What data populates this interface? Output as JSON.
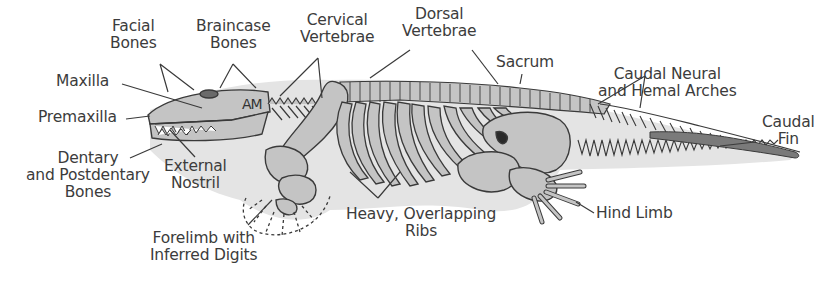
{
  "diagram": {
    "colors": {
      "body_shadow": "#e4e4e4",
      "bone_fill": "#c4c4c4",
      "bone_stroke": "#3a3a3a",
      "label_text": "#3c3c3c",
      "leader_line": "#3a3a3a"
    },
    "skull_marker": "AM",
    "labels": [
      {
        "id": "facial-bones",
        "lines": [
          "Facial",
          "Bones"
        ]
      },
      {
        "id": "braincase-bones",
        "lines": [
          "Braincase",
          "Bones"
        ]
      },
      {
        "id": "cervical-vertebrae",
        "lines": [
          "Cervical",
          "Vertebrae"
        ]
      },
      {
        "id": "dorsal-vertebrae",
        "lines": [
          "Dorsal",
          "Vertebrae"
        ]
      },
      {
        "id": "sacrum",
        "lines": [
          "Sacrum"
        ]
      },
      {
        "id": "caudal-arches",
        "lines": [
          "Caudal Neural",
          "and Hemal Arches"
        ]
      },
      {
        "id": "caudal-fin",
        "lines": [
          "Caudal",
          "Fin"
        ]
      },
      {
        "id": "maxilla",
        "lines": [
          "Maxilla"
        ]
      },
      {
        "id": "premaxilla",
        "lines": [
          "Premaxilla"
        ]
      },
      {
        "id": "dentary",
        "lines": [
          "Dentary",
          "and Postdentary",
          "Bones"
        ]
      },
      {
        "id": "external-nostril",
        "lines": [
          "External",
          "Nostril"
        ]
      },
      {
        "id": "forelimb",
        "lines": [
          "Forelimb with",
          "Inferred Digits"
        ]
      },
      {
        "id": "ribs",
        "lines": [
          "Heavy, Overlapping",
          "Ribs"
        ]
      },
      {
        "id": "hind-limb",
        "lines": [
          "Hind Limb"
        ]
      }
    ]
  }
}
